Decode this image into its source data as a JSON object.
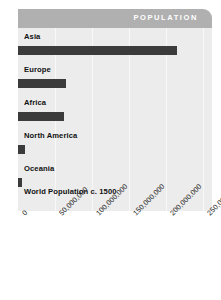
{
  "header": {
    "title": "POPULATION"
  },
  "chart_data": {
    "type": "bar",
    "orientation": "horizontal",
    "title": "POPULATION",
    "subtitle": "World Population c. 1500",
    "xlabel": "",
    "ylabel": "",
    "categories": [
      "Asia",
      "Europe",
      "Africa",
      "North America",
      "Oceania"
    ],
    "values": [
      215000000,
      65000000,
      62000000,
      9000000,
      5000000
    ],
    "series": [
      {
        "name": "Population c. 1500",
        "values": [
          215000000,
          65000000,
          62000000,
          9000000,
          5000000
        ]
      }
    ],
    "xlim": [
      0,
      262000000
    ],
    "xticks": [
      0,
      50000000,
      100000000,
      150000000,
      200000000,
      250000000
    ],
    "xtick_labels": [
      "0",
      "50,000,000",
      "100,000,000",
      "150,000,000",
      "200,000,000",
      "250,000,000"
    ],
    "grid": true,
    "legend": "none",
    "bar_color": "#3b3b3b",
    "plot_background": "#ececec",
    "banner_color": "#b0b0b0",
    "gridline_color": "#f8f8f8"
  },
  "bars": [
    {
      "label": "Asia",
      "value": 215000000
    },
    {
      "label": "Europe",
      "value": 65000000
    },
    {
      "label": "Africa",
      "value": 62000000
    },
    {
      "label": "North America",
      "value": 9000000
    },
    {
      "label": "Oceania",
      "value": 5000000
    }
  ],
  "footnote": {
    "text": "World Population c. 1500"
  },
  "ticks": [
    {
      "label": "0"
    },
    {
      "label": "50,000,000"
    },
    {
      "label": "100,000,000"
    },
    {
      "label": "150,000,000"
    },
    {
      "label": "200,000,000"
    },
    {
      "label": "250,000,000"
    }
  ]
}
